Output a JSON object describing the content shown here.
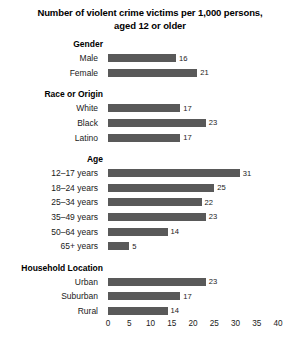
{
  "chart_data": {
    "type": "bar",
    "orientation": "horizontal",
    "title_lines": [
      "Number of violent crime victims per 1,000 persons,",
      "aged 12 or older"
    ],
    "title": "Number of violent crime victims per 1,000 persons, aged 12 or older",
    "xlabel": "",
    "ylabel": "",
    "xlim": [
      0,
      40
    ],
    "xticks": [
      0,
      5,
      10,
      15,
      20,
      25,
      30,
      35,
      40
    ],
    "xtick_labels": [
      "0",
      "5",
      "10",
      "15",
      "20",
      "25",
      "30",
      "35",
      "40"
    ],
    "grid": false,
    "legend": false,
    "bar_color": "#595959",
    "categories": [
      "Male",
      "Female",
      "White",
      "Black",
      "Latino",
      "12–17 years",
      "18–24 years",
      "25–34 years",
      "35–49 years",
      "50–64 years",
      "65+ years",
      "Urban",
      "Suburban",
      "Rural"
    ],
    "values": [
      16,
      21,
      17,
      23,
      17,
      31,
      25,
      22,
      23,
      14,
      5,
      23,
      17,
      14
    ],
    "groups": [
      {
        "heading": "Gender",
        "bars": [
          {
            "label": "Male",
            "value": 16,
            "value_label": "16"
          },
          {
            "label": "Female",
            "value": 21,
            "value_label": "21"
          }
        ]
      },
      {
        "heading": "Race or Origin",
        "bars": [
          {
            "label": "White",
            "value": 17,
            "value_label": "17"
          },
          {
            "label": "Black",
            "value": 23,
            "value_label": "23"
          },
          {
            "label": "Latino",
            "value": 17,
            "value_label": "17"
          }
        ]
      },
      {
        "heading": "Age",
        "bars": [
          {
            "label": "12–17 years",
            "value": 31,
            "value_label": "31"
          },
          {
            "label": "18–24 years",
            "value": 25,
            "value_label": "25"
          },
          {
            "label": "25–34 years",
            "value": 22,
            "value_label": "22"
          },
          {
            "label": "35–49 years",
            "value": 23,
            "value_label": "23"
          },
          {
            "label": "50–64 years",
            "value": 14,
            "value_label": "14"
          },
          {
            "label": "65+ years",
            "value": 5,
            "value_label": "5"
          }
        ]
      },
      {
        "heading": "Household Location",
        "bars": [
          {
            "label": "Urban",
            "value": 23,
            "value_label": "23"
          },
          {
            "label": "Suburban",
            "value": 17,
            "value_label": "17"
          },
          {
            "label": "Rural",
            "value": 14,
            "value_label": "14"
          }
        ]
      }
    ]
  }
}
